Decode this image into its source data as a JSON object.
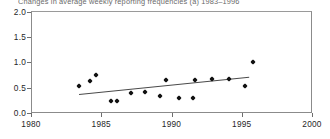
{
  "chart_data": {
    "type": "scatter",
    "title": "Changes in average weekly reporting frequencies (a) 1983–1996",
    "xlabel": "",
    "ylabel": "",
    "xlim": [
      1980,
      2000
    ],
    "ylim": [
      0.0,
      2.0
    ],
    "xticks": [
      "1980",
      "1985",
      "1990",
      "1995",
      "2000"
    ],
    "yticks": [
      "0.0",
      "0.5",
      "1.0",
      "1.5",
      "2.0"
    ],
    "grid": false,
    "legend": null,
    "series": [
      {
        "name": "Average weekly reporting frequency",
        "marker": "diamond",
        "color": "#111111",
        "points": [
          {
            "x": 1983.4,
            "y": 0.53
          },
          {
            "x": 1984.2,
            "y": 0.63
          },
          {
            "x": 1984.6,
            "y": 0.75
          },
          {
            "x": 1985.7,
            "y": 0.24
          },
          {
            "x": 1986.1,
            "y": 0.24
          },
          {
            "x": 1987.1,
            "y": 0.39
          },
          {
            "x": 1988.1,
            "y": 0.41
          },
          {
            "x": 1989.2,
            "y": 0.34
          },
          {
            "x": 1989.6,
            "y": 0.65
          },
          {
            "x": 1990.5,
            "y": 0.3
          },
          {
            "x": 1991.5,
            "y": 0.3
          },
          {
            "x": 1991.7,
            "y": 0.65
          },
          {
            "x": 1992.9,
            "y": 0.67
          },
          {
            "x": 1994.1,
            "y": 0.67
          },
          {
            "x": 1995.2,
            "y": 0.53
          },
          {
            "x": 1995.8,
            "y": 1.0
          }
        ]
      }
    ],
    "trendline": {
      "name": "linear trend",
      "color": "#4a4a4a",
      "x_start": 1983.4,
      "y_start": 0.38,
      "x_end": 1995.5,
      "y_end": 0.72
    }
  }
}
